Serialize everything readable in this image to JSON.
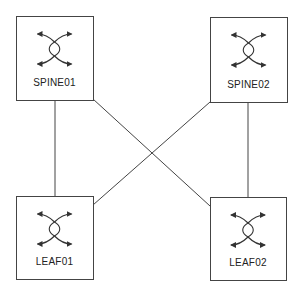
{
  "diagram": {
    "type": "spine-leaf-topology",
    "colors": {
      "background": "#ffffff",
      "stroke": "#444444",
      "label": "#222222"
    },
    "nodes": [
      {
        "id": "spine01",
        "label": "SPINE01",
        "role": "spine",
        "icon": "switch-icon",
        "x": 16,
        "y": 16,
        "w": 77,
        "h": 84
      },
      {
        "id": "spine02",
        "label": "SPINE02",
        "role": "spine",
        "icon": "switch-icon",
        "x": 210,
        "y": 17,
        "w": 77,
        "h": 85
      },
      {
        "id": "leaf01",
        "label": "LEAF01",
        "role": "leaf",
        "icon": "switch-icon",
        "x": 16,
        "y": 196,
        "w": 77,
        "h": 83
      },
      {
        "id": "leaf02",
        "label": "LEAF02",
        "role": "leaf",
        "icon": "switch-icon",
        "x": 210,
        "y": 197,
        "w": 76,
        "h": 83
      }
    ],
    "links": [
      {
        "from": "spine01",
        "to": "leaf01",
        "x1": 55,
        "y1": 100,
        "x2": 55,
        "y2": 196
      },
      {
        "from": "spine02",
        "to": "leaf02",
        "x1": 248,
        "y1": 102,
        "x2": 248,
        "y2": 197
      },
      {
        "from": "spine01",
        "to": "leaf02",
        "x1": 93,
        "y1": 99,
        "x2": 210,
        "y2": 206
      },
      {
        "from": "spine02",
        "to": "leaf01",
        "x1": 210,
        "y1": 102,
        "x2": 93,
        "y2": 205
      }
    ]
  }
}
